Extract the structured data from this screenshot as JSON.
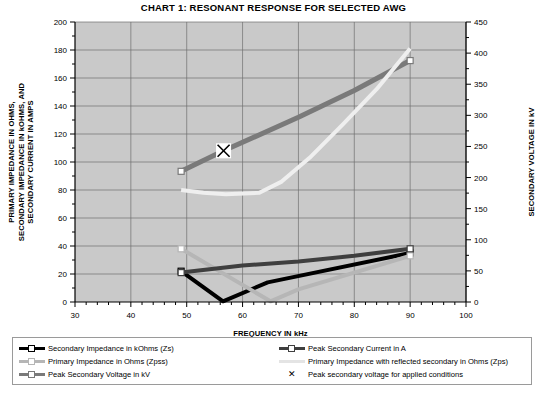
{
  "title": "CHART 1:  RESONANT RESPONSE FOR SELECTED AWG",
  "axes": {
    "x_label": "FREQUENCY IN kHz",
    "y_left_line1": "PRIMARY IMPEDANCE IN OHMS,",
    "y_left_line2": "SECONDARY IMPEDANCE IN kOHMS, AND",
    "y_left_line3": "SECONDARY CURRENT IN AMPS",
    "y_right_label": "SECONDARY VOLTAGE IN kV",
    "x_ticks": [
      "30",
      "40",
      "50",
      "60",
      "70",
      "80",
      "90",
      "100"
    ],
    "y_left_ticks": [
      "0",
      "20",
      "40",
      "60",
      "80",
      "100",
      "120",
      "140",
      "160",
      "180",
      "200"
    ],
    "y_right_ticks": [
      "0",
      "50",
      "100",
      "150",
      "200",
      "250",
      "300",
      "350",
      "400",
      "450"
    ]
  },
  "colors": {
    "plot_background": "#c9c9c9",
    "grid": "#6e6e6e",
    "axis": "#000000",
    "series_zs": "#000000",
    "series_zpss": "#b6b6b6",
    "series_peak_voltage": "#7a7a7a",
    "series_peak_current": "#3f3f3f",
    "series_zps": "#efefef",
    "marker_x": "#000000"
  },
  "legend": {
    "left": [
      {
        "label": "Secondary Impedance in kOhms (Zs)",
        "key": "zs",
        "style": "line-marker"
      },
      {
        "label": "Primary Impedance in Ohms (Zpss)",
        "key": "zpss",
        "style": "line-marker"
      },
      {
        "label": "Peak Secondary Voltage in kV",
        "key": "peak_voltage",
        "style": "line-marker"
      }
    ],
    "right": [
      {
        "label": "Peak Secondary Current in A",
        "key": "peak_current",
        "style": "line-marker"
      },
      {
        "label": "Primary Impedance with reflected secondary in Ohms (Zps)",
        "key": "zps",
        "style": "line"
      },
      {
        "label": "Peak secondary voltage for applied conditions",
        "key": "marker_x",
        "style": "x"
      }
    ]
  },
  "chart_data": {
    "type": "line",
    "title": "CHART 1:  RESONANT RESPONSE FOR SELECTED AWG",
    "xlabel": "FREQUENCY IN kHz",
    "ylabel": "PRIMARY IMPEDANCE IN OHMS, SECONDARY IMPEDANCE IN kOHMS, AND SECONDARY CURRENT IN AMPS",
    "y2label": "SECONDARY VOLTAGE IN kV",
    "xlim": [
      30,
      100
    ],
    "ylim": [
      0,
      200
    ],
    "y2lim": [
      0,
      450
    ],
    "xticks": [
      30,
      40,
      50,
      60,
      70,
      80,
      90,
      100
    ],
    "yticks": [
      0,
      20,
      40,
      60,
      80,
      100,
      120,
      140,
      160,
      180,
      200
    ],
    "y2ticks": [
      0,
      50,
      100,
      150,
      200,
      250,
      300,
      350,
      400,
      450
    ],
    "grid": true,
    "legend_position": "below",
    "series": [
      {
        "name": "Secondary Impedance in kOhms (Zs)",
        "key": "zs",
        "axis": "left",
        "color": "#000000",
        "width": 4,
        "marker": "square-open-ends",
        "points": [
          [
            49,
            22
          ],
          [
            56.5,
            0.5
          ],
          [
            64.5,
            14
          ],
          [
            90,
            35
          ]
        ]
      },
      {
        "name": "Primary Impedance in Ohms (Zpss)",
        "key": "zpss",
        "axis": "left",
        "color": "#b6b6b6",
        "width": 4,
        "marker": "square-open-ends",
        "points": [
          [
            49,
            38
          ],
          [
            65,
            0.5
          ],
          [
            70,
            9
          ],
          [
            90,
            33
          ]
        ]
      },
      {
        "name": "Peak Secondary Voltage in kV",
        "key": "peak_voltage",
        "axis": "right",
        "color": "#7a7a7a",
        "width": 5,
        "marker": "square-open-ends",
        "points": [
          [
            49,
            210
          ],
          [
            56.6,
            243
          ],
          [
            70,
            297
          ],
          [
            80,
            340
          ],
          [
            90,
            388
          ]
        ]
      },
      {
        "name": "Peak Secondary Current in A",
        "key": "peak_current",
        "axis": "left",
        "color": "#3f3f3f",
        "width": 4,
        "marker": "square-open-ends",
        "points": [
          [
            49,
            21
          ],
          [
            60,
            26
          ],
          [
            70,
            29
          ],
          [
            80,
            33
          ],
          [
            90,
            38
          ]
        ]
      },
      {
        "name": "Primary Impedance with reflected secondary in Ohms (Zps)",
        "key": "zps",
        "axis": "left",
        "color": "#efefef",
        "width": 4,
        "marker": "none",
        "points": [
          [
            49,
            80
          ],
          [
            53,
            78
          ],
          [
            57,
            77
          ],
          [
            63,
            78
          ],
          [
            67,
            86
          ],
          [
            72,
            103
          ],
          [
            78,
            127
          ],
          [
            84,
            152
          ],
          [
            90,
            181
          ]
        ]
      }
    ],
    "annotations": [
      {
        "name": "Peak secondary voltage for applied conditions",
        "marker": "x-in-square",
        "x": 56.6,
        "y_left": 108,
        "y_right": 243
      }
    ]
  }
}
